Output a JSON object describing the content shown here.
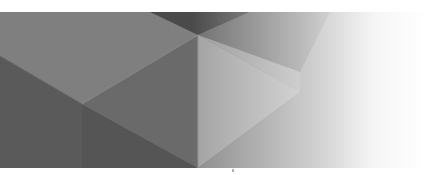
{
  "banner": {
    "type": "abstract-geometric-header",
    "colors": {
      "darkest": "#3a3a3a",
      "dark": "#555555",
      "mid_dark": "#666666",
      "mid": "#7d7d7d",
      "mid_light": "#929292",
      "light": "#a4a4a4",
      "fade_to": "#ffffff"
    }
  }
}
